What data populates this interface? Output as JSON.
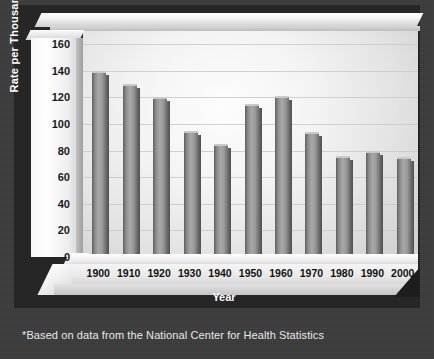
{
  "chart_data": {
    "type": "bar",
    "title": "",
    "xlabel": "Year",
    "ylabel": "Rate per Thousand",
    "categories": [
      "1900",
      "1910",
      "1920",
      "1930",
      "1940",
      "1950",
      "1960",
      "1970",
      "1980",
      "1990",
      "2000"
    ],
    "values": [
      140,
      130,
      120,
      95,
      85,
      115,
      121,
      94,
      76,
      80,
      75
    ],
    "yticks": [
      0,
      20,
      40,
      60,
      80,
      100,
      120,
      140,
      160
    ],
    "ylim": [
      0,
      170
    ],
    "grid": true,
    "legend": "none",
    "series": [
      {
        "name": "Rate per Thousand",
        "values": [
          140,
          130,
          120,
          95,
          85,
          115,
          121,
          94,
          76,
          80,
          75
        ]
      }
    ],
    "annotations": [
      "*Based on data from the National Center for Health Statistics"
    ]
  },
  "figure": {
    "footnote": "*Based on data from the National Center for Health Statistics",
    "colors": {
      "background": "#3b3b3b",
      "panel": "#262626",
      "plot_area": "#f2f2f2",
      "bar": "#9a9a9a",
      "axis_text": "#111111",
      "title_text": "#ffffff"
    }
  }
}
